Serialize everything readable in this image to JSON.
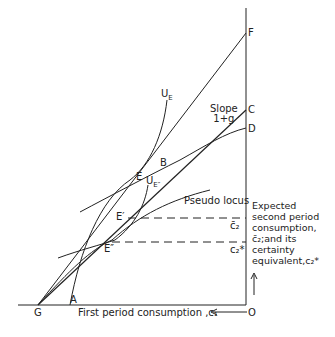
{
  "figure": {
    "axis_labels": {
      "x": "First period consumption ,c₁",
      "origin": "O"
    },
    "points": {
      "F": "F",
      "C": "C",
      "D": "D",
      "G": "G",
      "A": "A",
      "E": "E",
      "B": "B",
      "E_prime": "E′",
      "E_double": "E″"
    },
    "curves": {
      "U_E": "U",
      "U_E_sub": "E",
      "U_Estar": "U",
      "U_Estar_sub": "E″",
      "pseudo_locus": "Pseudo locus"
    },
    "slope_label": {
      "line1": "Slope",
      "line2": "1+g"
    },
    "dashed_labels": {
      "c2_bar": "c̄₂",
      "c2_star": "c₂*"
    },
    "annotation": {
      "line1": "Expected",
      "line2": "second period",
      "line3": "consumption,",
      "line4": "c̄₂;and its",
      "line5": "certainty",
      "line6": "equivalent,c₂*"
    }
  }
}
